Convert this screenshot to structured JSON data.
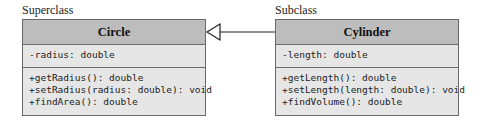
{
  "superclass": {
    "label": "Superclass",
    "name": "Circle",
    "attributes": [
      "-radius: double"
    ],
    "methods": [
      "+getRadius(): double",
      "+setRadius(radius: double): void",
      "+findArea(): double"
    ]
  },
  "subclass": {
    "label": "Subclass",
    "name": "Cylinder",
    "attributes": [
      "-length: double"
    ],
    "methods": [
      "+getLength(): double",
      "+setLength(length: double): void",
      "+findVolume(): double"
    ]
  },
  "relationship": {
    "type": "generalization",
    "from": "Cylinder",
    "to": "Circle"
  },
  "colors": {
    "header": "#bdbdbd",
    "body": "#e6e6e6",
    "border": "#6a6a6a"
  }
}
